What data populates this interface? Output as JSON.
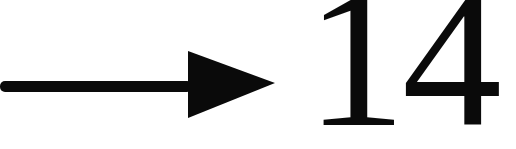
{
  "figure": {
    "number_label": "14",
    "arrow_direction": "right",
    "colors": {
      "foreground": "#0a0a0a",
      "background": "#ffffff"
    }
  }
}
